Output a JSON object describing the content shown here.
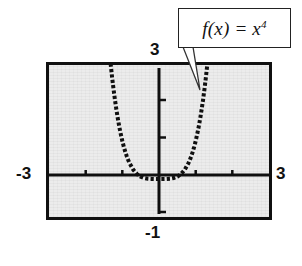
{
  "figure": {
    "name": "graphing-calculator-plot-of-quartic-function",
    "background_color": "#ffffff",
    "screen_fill_color": "#ececec",
    "ink_color": "#101010"
  },
  "callout": {
    "function_prefix": "f(x) = x",
    "function_exponent": "4",
    "full_text": "f(x) = x4",
    "border_color": "#222222",
    "fill_color": "#ffffff",
    "pointer_target": "right-branch-of-curve"
  },
  "axis_labels": {
    "y_max": "3",
    "y_min": "-1",
    "x_min": "-3",
    "x_max": "3"
  },
  "chart_data": {
    "type": "line",
    "title": "",
    "subtitle": "",
    "xlabel": "",
    "ylabel": "",
    "expression": "f(x) = x^4",
    "xlim": [
      -3,
      3
    ],
    "ylim": [
      -1,
      3
    ],
    "xtick_step": 1,
    "ytick_step": 1,
    "xticks": [
      -3,
      -2,
      -1,
      0,
      1,
      2,
      3
    ],
    "yticks": [
      -1,
      0,
      1,
      2,
      3
    ],
    "tick_labels_shown": false,
    "grid": false,
    "legend": "callout-box",
    "legend_position": "top-right",
    "axes_style": "graphing-calculator-viewport",
    "series": [
      {
        "name": "f(x) = x^4",
        "style": "dotted-thick-black",
        "color": "#101010",
        "x": [
          -1.32,
          -1.28,
          -1.24,
          -1.2,
          -1.16,
          -1.12,
          -1.08,
          -1.04,
          -1.0,
          -0.96,
          -0.92,
          -0.88,
          -0.84,
          -0.8,
          -0.7,
          -0.6,
          -0.5,
          -0.4,
          -0.3,
          -0.2,
          -0.1,
          0.0,
          0.1,
          0.2,
          0.3,
          0.4,
          0.5,
          0.6,
          0.7,
          0.8,
          0.84,
          0.88,
          0.92,
          0.96,
          1.0,
          1.04,
          1.08,
          1.12,
          1.16,
          1.2,
          1.24,
          1.28,
          1.32
        ],
        "y": [
          3.036,
          2.684,
          2.364,
          2.074,
          1.811,
          1.573,
          1.36,
          1.17,
          1.0,
          0.849,
          0.716,
          0.6,
          0.498,
          0.41,
          0.24,
          0.13,
          0.063,
          0.026,
          0.008,
          0.002,
          0.0,
          0.0,
          0.0,
          0.002,
          0.008,
          0.026,
          0.063,
          0.13,
          0.24,
          0.41,
          0.498,
          0.6,
          0.716,
          0.849,
          1.0,
          1.17,
          1.36,
          1.573,
          1.811,
          2.074,
          2.364,
          2.684,
          3.036
        ]
      }
    ]
  }
}
